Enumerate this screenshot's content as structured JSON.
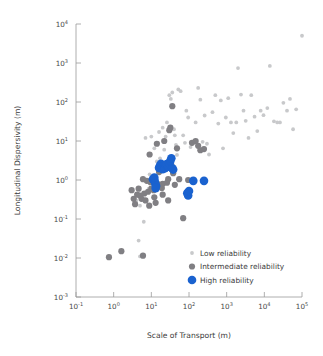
{
  "chart_data": {
    "type": "scatter",
    "title": "",
    "xlabel": "Scale of Transport (m)",
    "ylabel": "Longitudinal Dispersivity (m)",
    "xscale": "log",
    "yscale": "log",
    "xlim": [
      0.1,
      100000
    ],
    "ylim": [
      0.001,
      10000
    ],
    "grid": false,
    "xtick_labels": [
      "10⁻¹",
      "10⁰",
      "10¹",
      "10²",
      "10³",
      "10⁴",
      "10⁵"
    ],
    "xtick_values": [
      0.1,
      1,
      10,
      100,
      1000,
      10000,
      100000
    ],
    "xtick_mantissa": [
      "10",
      "10",
      "10",
      "10",
      "10",
      "10",
      "10"
    ],
    "xtick_exponent": [
      "-1",
      "0",
      "1",
      "2",
      "3",
      "4",
      "5"
    ],
    "ytick_labels": [
      "10⁻³",
      "10⁻²",
      "10⁻¹",
      "10⁰",
      "10¹",
      "10²",
      "10³",
      "10⁴"
    ],
    "ytick_values": [
      0.001,
      0.01,
      0.1,
      1,
      10,
      100,
      1000,
      10000
    ],
    "ytick_mantissa": [
      "10",
      "10",
      "10",
      "10",
      "10",
      "10",
      "10",
      "10"
    ],
    "ytick_exponent": [
      "-3",
      "-2",
      "-1",
      "0",
      "1",
      "2",
      "3",
      "4"
    ],
    "legend_position": "lower-right-inside",
    "series": [
      {
        "name": "Low reliability",
        "color": "#c8c9cb",
        "marker_size": 1.9,
        "points": [
          [
            4.0,
            0.3
          ],
          [
            4.6,
            0.028
          ],
          [
            5.0,
            0.011
          ],
          [
            6.3,
            0.085
          ],
          [
            5.0,
            0.22
          ],
          [
            8.5,
            0.6
          ],
          [
            9.0,
            1.4
          ],
          [
            7.0,
            12.0
          ],
          [
            10.0,
            13.0
          ],
          [
            12.0,
            6.5
          ],
          [
            14.0,
            3.0
          ],
          [
            15.0,
            9.0
          ],
          [
            16.0,
            17.0
          ],
          [
            17.0,
            3.6
          ],
          [
            20.0,
            22.0
          ],
          [
            22.0,
            6.0
          ],
          [
            24.0,
            13.0
          ],
          [
            26.0,
            30.0
          ],
          [
            30.0,
            150.0
          ],
          [
            33.0,
            120.0
          ],
          [
            36.0,
            175.0
          ],
          [
            40.0,
            20.0
          ],
          [
            42.0,
            14.0
          ],
          [
            45.0,
            8.0
          ],
          [
            48.0,
            4.4
          ],
          [
            52.0,
            210.0
          ],
          [
            60.0,
            190.0
          ],
          [
            70.0,
            14.0
          ],
          [
            78.0,
            9.0
          ],
          [
            85.0,
            60.0
          ],
          [
            95.0,
            40.0
          ],
          [
            110.0,
            7.0
          ],
          [
            130.0,
            9.0
          ],
          [
            150.0,
            30.0
          ],
          [
            175.0,
            230.0
          ],
          [
            200.0,
            115.0
          ],
          [
            230.0,
            9.5
          ],
          [
            260.0,
            45.0
          ],
          [
            300.0,
            8.5
          ],
          [
            340.0,
            4.5
          ],
          [
            420.0,
            55.0
          ],
          [
            500.0,
            150.0
          ],
          [
            600.0,
            28.0
          ],
          [
            700.0,
            110.0
          ],
          [
            800.0,
            6.5
          ],
          [
            950.0,
            40.0
          ],
          [
            1100.0,
            125.0
          ],
          [
            1300.0,
            30.0
          ],
          [
            1500.0,
            16.0
          ],
          [
            1800.0,
            30.0
          ],
          [
            2000.0,
            740.0
          ],
          [
            2400.0,
            155.0
          ],
          [
            2800.0,
            60.0
          ],
          [
            3200.0,
            33.0
          ],
          [
            3800.0,
            12.0
          ],
          [
            4500.0,
            150.0
          ],
          [
            5500.0,
            42.0
          ],
          [
            6500.0,
            18.0
          ],
          [
            8000.0,
            60.0
          ],
          [
            9500.0,
            46.0
          ],
          [
            12000.0,
            70.0
          ],
          [
            14000.0,
            840.0
          ],
          [
            18000.0,
            32.0
          ],
          [
            22000.0,
            30.0
          ],
          [
            26000.0,
            30.0
          ],
          [
            32000.0,
            95.0
          ],
          [
            40000.0,
            60.0
          ],
          [
            48000.0,
            120.0
          ],
          [
            58000.0,
            20.0
          ],
          [
            70000.0,
            65.0
          ],
          [
            100000.0,
            5000.0
          ]
        ]
      },
      {
        "name": "Intermediate reliability",
        "color": "#807f83",
        "marker_size": 3.1,
        "points": [
          [
            0.75,
            0.0105
          ],
          [
            1.6,
            0.015
          ],
          [
            6.0,
            0.0115
          ],
          [
            3.0,
            0.55
          ],
          [
            3.4,
            0.33
          ],
          [
            3.7,
            0.24
          ],
          [
            4.2,
            0.42
          ],
          [
            4.6,
            0.6
          ],
          [
            5.0,
            0.4
          ],
          [
            5.5,
            0.33
          ],
          [
            6.0,
            1.05
          ],
          [
            6.5,
            0.45
          ],
          [
            7.0,
            0.3
          ],
          [
            7.6,
            0.95
          ],
          [
            8.2,
            0.5
          ],
          [
            9.0,
            4.5
          ],
          [
            9.5,
            0.88
          ],
          [
            10.0,
            0.6
          ],
          [
            11.0,
            1.0
          ],
          [
            12.0,
            0.36
          ],
          [
            13.0,
            0.26
          ],
          [
            14.0,
            8.5
          ],
          [
            15.0,
            0.78
          ],
          [
            16.0,
            1.6
          ],
          [
            18.0,
            2.0
          ],
          [
            19.0,
            0.62
          ],
          [
            20.0,
            0.8
          ],
          [
            22.0,
            10.0
          ],
          [
            24.0,
            2.2
          ],
          [
            26.0,
            0.85
          ],
          [
            28.0,
            1.05
          ],
          [
            30.0,
            19.0
          ],
          [
            32.0,
            22.0
          ],
          [
            34.0,
            2.4
          ],
          [
            36.0,
            78.0
          ],
          [
            38.0,
            1.5
          ],
          [
            42.0,
            0.75
          ],
          [
            48.0,
            6.5
          ],
          [
            55.0,
            1.05
          ],
          [
            70.0,
            0.105
          ],
          [
            95.0,
            1.0
          ],
          [
            120.0,
            9.0
          ],
          [
            150.0,
            10.0
          ],
          [
            200.0,
            5.8
          ],
          [
            250.0,
            6.2
          ],
          [
            175.0,
            7.5
          ],
          [
            28.0,
            0.3
          ],
          [
            20.0,
            0.42
          ],
          [
            11.5,
            0.55
          ],
          [
            8.8,
            0.22
          ]
        ]
      },
      {
        "name": "High reliability",
        "color": "#1a62cf",
        "marker_size": 4.3,
        "points": [
          [
            11.0,
            1.05
          ],
          [
            11.8,
            1.0
          ],
          [
            12.3,
            0.92
          ],
          [
            12.8,
            0.8
          ],
          [
            13.4,
            0.7
          ],
          [
            13.0,
            0.62
          ],
          [
            12.0,
            1.15
          ],
          [
            16.0,
            2.05
          ],
          [
            17.0,
            2.35
          ],
          [
            18.0,
            2.6
          ],
          [
            19.0,
            2.15
          ],
          [
            20.0,
            1.9
          ],
          [
            21.0,
            2.1
          ],
          [
            22.0,
            2.3
          ],
          [
            23.0,
            2.0
          ],
          [
            24.0,
            2.45
          ],
          [
            26.0,
            2.55
          ],
          [
            28.0,
            2.2
          ],
          [
            30.0,
            2.7
          ],
          [
            32.0,
            3.1
          ],
          [
            34.0,
            3.6
          ],
          [
            36.0,
            2.0
          ],
          [
            38.0,
            1.85
          ],
          [
            90.0,
            0.46
          ],
          [
            95.0,
            0.4
          ],
          [
            100.0,
            0.52
          ],
          [
            130.0,
            0.95
          ],
          [
            250.0,
            0.95
          ]
        ]
      }
    ]
  },
  "legend": {
    "items": [
      {
        "label": "Low reliability",
        "color": "#c8c9cb",
        "size": 1.9
      },
      {
        "label": "Intermediate reliability",
        "color": "#807f83",
        "size": 3.1
      },
      {
        "label": "High reliability",
        "color": "#1a62cf",
        "size": 4.3
      }
    ]
  },
  "colors": {
    "low": "#c8c9cb",
    "intermediate": "#807f83",
    "high": "#1a62cf",
    "axis": "#9a9a9a",
    "text": "#3b3b3b",
    "background": "#ffffff"
  }
}
